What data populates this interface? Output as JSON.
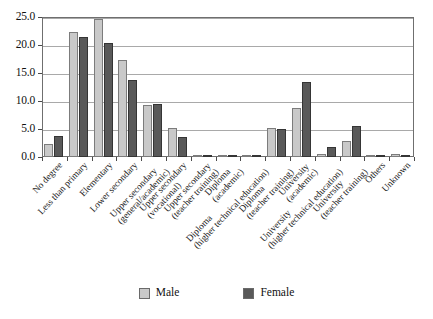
{
  "chart_data": {
    "type": "bar",
    "title": "",
    "subtitle": "",
    "xlabel": "",
    "ylabel": "",
    "ylim": [
      0,
      25
    ],
    "yticks": [
      "0.0",
      "5.0",
      "10.0",
      "15.0",
      "20.0",
      "25.0"
    ],
    "ytick_values": [
      0,
      5,
      10,
      15,
      20,
      25
    ],
    "grid": true,
    "legend_position": "bottom",
    "orientation": "vertical",
    "categories": [
      "No degree",
      "Less than primary",
      "Elementary",
      "Lower secondary",
      "Upper secondary (general/academic)",
      "Upper secondary (vocational)",
      "Upper secondary (teacher training)",
      "Diploma (academic)",
      "Diploma (higher technical education)",
      "Diploma (teacher training)",
      "University (academic)",
      "University (higher technical education)",
      "University (teacher training)",
      "Others",
      "Unknown"
    ],
    "category_lines": [
      [
        "No degree",
        ""
      ],
      [
        "Less than primary",
        ""
      ],
      [
        "Elementary",
        ""
      ],
      [
        "Lower secondary",
        ""
      ],
      [
        "Upper secondary",
        "(general/academic)"
      ],
      [
        "Upper secondary",
        "(vocational)"
      ],
      [
        "Upper secondary",
        "(teacher training)"
      ],
      [
        "Diploma",
        "(academic)"
      ],
      [
        "Diploma",
        "(higher technical education)"
      ],
      [
        "Diploma",
        "(teacher training)"
      ],
      [
        "University",
        "(academic)"
      ],
      [
        "University",
        "(higher technical education)"
      ],
      [
        "University",
        "(teacher training)"
      ],
      [
        "Others",
        ""
      ],
      [
        "Unknown",
        ""
      ]
    ],
    "series": [
      {
        "name": "Male",
        "color": "#c9c9c9",
        "values": [
          2.3,
          22.3,
          24.6,
          17.4,
          9.3,
          5.1,
          0.0,
          0.2,
          0.1,
          5.1,
          8.7,
          0.6,
          2.9,
          0.1,
          0.5
        ]
      },
      {
        "name": "Female",
        "color": "#595959",
        "values": [
          3.7,
          21.4,
          20.4,
          13.8,
          9.5,
          3.6,
          0.0,
          0.2,
          0.1,
          5.0,
          13.4,
          1.7,
          5.6,
          0.1,
          0.4
        ]
      }
    ]
  },
  "legend": {
    "entries": [
      {
        "label": "Male"
      },
      {
        "label": "Female"
      }
    ]
  }
}
